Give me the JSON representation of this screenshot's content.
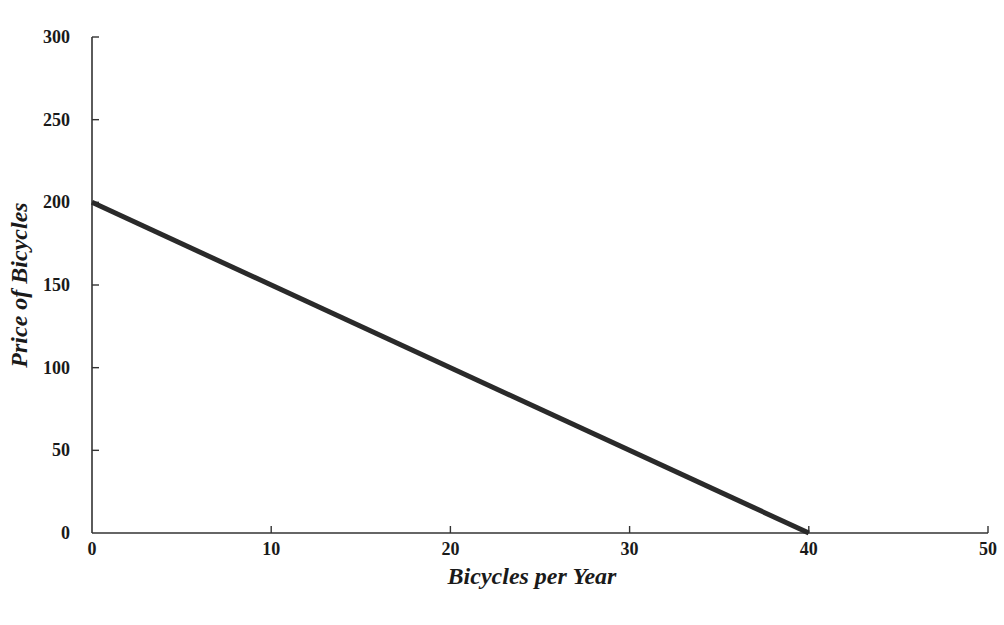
{
  "chart_data": {
    "type": "line",
    "title": "",
    "xlabel": "Bicycles per Year",
    "ylabel": "Price of Bicycles",
    "xlim": [
      0,
      50
    ],
    "ylim": [
      0,
      300
    ],
    "x_ticks": [
      0,
      10,
      20,
      30,
      40,
      50
    ],
    "y_ticks": [
      0,
      50,
      100,
      150,
      200,
      250,
      300
    ],
    "grid": false,
    "legend": null,
    "series": [
      {
        "name": "Demand",
        "x": [
          0,
          40
        ],
        "y": [
          200,
          0
        ],
        "color": "#2a2a2a"
      }
    ]
  },
  "colors": {
    "axis": "#333333",
    "line": "#2a2a2a",
    "text": "#1a1a1a",
    "background": "#ffffff"
  }
}
